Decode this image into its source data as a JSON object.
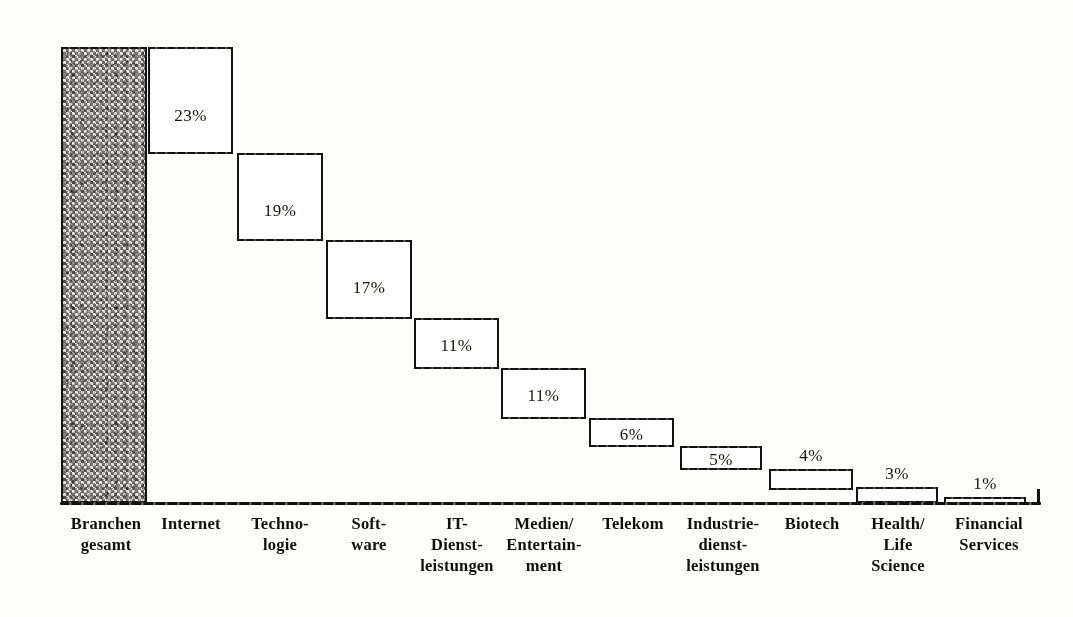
{
  "chart_data": {
    "type": "bar",
    "title": "",
    "subtitle": "",
    "xlabel": "",
    "ylabel": "",
    "grid": false,
    "legend": "none",
    "axis": {
      "baseline_visible": true,
      "y_axis_visible": false,
      "ylim": [
        0,
        23
      ]
    },
    "categories": [
      "Branchen gesamt",
      "Internet",
      "Techno-logie",
      "Soft-ware",
      "IT-Dienst-leistungen",
      "Medien/Entertain-ment",
      "Telekom",
      "Industrie-dienst-leistungen",
      "Biotech",
      "Health/Life Science",
      "Financial Services"
    ],
    "values": [
      100,
      23,
      19,
      17,
      11,
      11,
      6,
      5,
      4,
      3,
      1
    ],
    "value_labels": [
      "",
      "23%",
      "19%",
      "17%",
      "11%",
      "11%",
      "6%",
      "5%",
      "4%",
      "3%",
      "1%"
    ]
  },
  "bars": [
    {
      "name": "branchen-gesamt",
      "label": "",
      "fill": "textured-grey",
      "x": 61,
      "y": 47,
      "w": 86,
      "h": 456,
      "label_position": "none"
    },
    {
      "name": "internet",
      "label": "23%",
      "fill": "white",
      "x": 148,
      "y": 47,
      "w": 85,
      "h": 107,
      "label_position": "inside",
      "label_offset": 57
    },
    {
      "name": "technologie",
      "label": "19%",
      "fill": "white",
      "x": 237,
      "y": 153,
      "w": 86,
      "h": 88,
      "label_position": "inside",
      "label_offset": 46
    },
    {
      "name": "software",
      "label": "17%",
      "fill": "white",
      "x": 326,
      "y": 240,
      "w": 86,
      "h": 79,
      "label_position": "inside",
      "label_offset": 36
    },
    {
      "name": "it-dienstleistungen",
      "label": "11%",
      "fill": "white",
      "x": 414,
      "y": 318,
      "w": 85,
      "h": 51,
      "label_position": "inside",
      "label_offset": 16
    },
    {
      "name": "medien-entertainment",
      "label": "11%",
      "fill": "white",
      "x": 501,
      "y": 368,
      "w": 85,
      "h": 51,
      "label_position": "inside",
      "label_offset": 16
    },
    {
      "name": "telekom",
      "label": "6%",
      "fill": "white",
      "x": 589,
      "y": 418,
      "w": 85,
      "h": 29,
      "label_position": "inside",
      "label_offset": 5
    },
    {
      "name": "industriedienstleistungen",
      "label": "5%",
      "fill": "white",
      "x": 680,
      "y": 446,
      "w": 82,
      "h": 24,
      "label_position": "inside",
      "label_offset": 2
    },
    {
      "name": "biotech",
      "label": "4%",
      "fill": "white",
      "x": 769,
      "y": 469,
      "w": 84,
      "h": 21,
      "label_position": "above"
    },
    {
      "name": "health-life-science",
      "label": "3%",
      "fill": "white",
      "x": 856,
      "y": 487,
      "w": 82,
      "h": 16,
      "label_position": "above"
    },
    {
      "name": "financial-services",
      "label": "1%",
      "fill": "white",
      "x": 944,
      "y": 497,
      "w": 82,
      "h": 7,
      "label_position": "above"
    }
  ],
  "x_labels": [
    {
      "name": "branchen-gesamt",
      "lines": [
        "Branchen",
        "gesamt"
      ],
      "x": 61,
      "w": 90
    },
    {
      "name": "internet",
      "lines": [
        "Internet"
      ],
      "x": 146,
      "w": 90
    },
    {
      "name": "technologie",
      "lines": [
        "Techno-",
        "logie"
      ],
      "x": 235,
      "w": 90
    },
    {
      "name": "software",
      "lines": [
        "Soft-",
        "ware"
      ],
      "x": 324,
      "w": 90
    },
    {
      "name": "it-dienstleistungen",
      "lines": [
        "IT-",
        "Dienst-",
        "leistungen"
      ],
      "x": 406,
      "w": 102
    },
    {
      "name": "medien-entertainment",
      "lines": [
        "Medien/",
        "Entertain-",
        "ment"
      ],
      "x": 493,
      "w": 102
    },
    {
      "name": "telekom",
      "lines": [
        "Telekom"
      ],
      "x": 588,
      "w": 90
    },
    {
      "name": "industriedienstleistungen",
      "lines": [
        "Industrie-",
        "dienst-",
        "leistungen"
      ],
      "x": 671,
      "w": 104
    },
    {
      "name": "biotech",
      "lines": [
        "Biotech"
      ],
      "x": 768,
      "w": 88
    },
    {
      "name": "health-life-science",
      "lines": [
        "Health/",
        "Life",
        "Science"
      ],
      "x": 853,
      "w": 90
    },
    {
      "name": "financial-services",
      "lines": [
        "Financial",
        "Services"
      ],
      "x": 941,
      "w": 96
    }
  ],
  "colors": {
    "ink": "#16120f",
    "background": "#fdfdfb",
    "bar_fill": "#ffffff",
    "total_bar_fill": "#e9e8e4"
  }
}
